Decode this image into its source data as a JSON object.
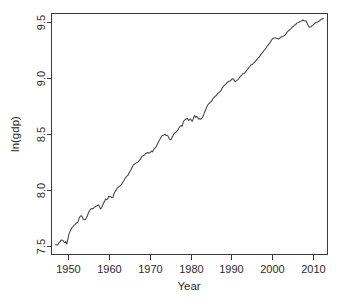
{
  "chart_data": {
    "type": "line",
    "title": "",
    "xlabel": "Year",
    "ylabel": "ln(gdp)",
    "xlim": [
      1946.0,
      1913.0
    ],
    "x_range": [
      1946.0,
      2013.5
    ],
    "ylim": [
      7.42,
      9.58
    ],
    "grid": false,
    "legend": null,
    "xticks": [
      1950,
      1960,
      1970,
      1980,
      1990,
      2000,
      2010
    ],
    "xtick_labels": [
      "1950",
      "1960",
      "1970",
      "1980",
      "1990",
      "2000",
      "2010"
    ],
    "yticks": [
      7.5,
      8.0,
      8.5,
      9.0,
      9.5
    ],
    "ytick_labels": [
      "7.5",
      "8.0",
      "8.5",
      "9.0",
      "9.5"
    ],
    "line_color": "#4a4a4a",
    "frame_color": "#3a3a3a",
    "background": "#ffffff",
    "series": [
      {
        "name": "ln(gdp)",
        "x": [
          1947.0,
          1947.25,
          1947.5,
          1947.75,
          1948.0,
          1948.25,
          1948.5,
          1948.75,
          1949.0,
          1949.25,
          1949.5,
          1949.75,
          1950.0,
          1950.25,
          1950.5,
          1950.75,
          1951.0,
          1951.25,
          1951.5,
          1951.75,
          1952.0,
          1952.25,
          1952.5,
          1952.75,
          1953.0,
          1953.25,
          1953.5,
          1953.75,
          1954.0,
          1954.25,
          1954.5,
          1954.75,
          1955.0,
          1955.25,
          1955.5,
          1955.75,
          1956.0,
          1956.25,
          1956.5,
          1956.75,
          1957.0,
          1957.25,
          1957.5,
          1957.75,
          1958.0,
          1958.25,
          1958.5,
          1958.75,
          1959.0,
          1959.25,
          1959.5,
          1959.75,
          1960.0,
          1960.25,
          1960.5,
          1960.75,
          1961.0,
          1961.25,
          1961.5,
          1961.75,
          1962.0,
          1962.25,
          1962.5,
          1962.75,
          1963.0,
          1963.25,
          1963.5,
          1963.75,
          1964.0,
          1964.25,
          1964.5,
          1964.75,
          1965.0,
          1965.25,
          1965.5,
          1965.75,
          1966.0,
          1966.25,
          1966.5,
          1966.75,
          1967.0,
          1967.25,
          1967.5,
          1967.75,
          1968.0,
          1968.25,
          1968.5,
          1968.75,
          1969.0,
          1969.25,
          1969.5,
          1969.75,
          1970.0,
          1970.25,
          1970.5,
          1970.75,
          1971.0,
          1971.25,
          1971.5,
          1971.75,
          1972.0,
          1972.25,
          1972.5,
          1972.75,
          1973.0,
          1973.25,
          1973.5,
          1973.75,
          1974.0,
          1974.25,
          1974.5,
          1974.75,
          1975.0,
          1975.25,
          1975.5,
          1975.75,
          1976.0,
          1976.25,
          1976.5,
          1976.75,
          1977.0,
          1977.25,
          1977.5,
          1977.75,
          1978.0,
          1978.25,
          1978.5,
          1978.75,
          1979.0,
          1979.25,
          1979.5,
          1979.75,
          1980.0,
          1980.25,
          1980.5,
          1980.75,
          1981.0,
          1981.25,
          1981.5,
          1981.75,
          1982.0,
          1982.25,
          1982.5,
          1982.75,
          1983.0,
          1983.25,
          1983.5,
          1983.75,
          1984.0,
          1984.25,
          1984.5,
          1984.75,
          1985.0,
          1985.25,
          1985.5,
          1985.75,
          1986.0,
          1986.25,
          1986.5,
          1986.75,
          1987.0,
          1987.25,
          1987.5,
          1987.75,
          1988.0,
          1988.25,
          1988.5,
          1988.75,
          1989.0,
          1989.25,
          1989.5,
          1989.75,
          1990.0,
          1990.25,
          1990.5,
          1990.75,
          1991.0,
          1991.25,
          1991.5,
          1991.75,
          1992.0,
          1992.25,
          1992.5,
          1992.75,
          1993.0,
          1993.25,
          1993.5,
          1993.75,
          1994.0,
          1994.25,
          1994.5,
          1994.75,
          1995.0,
          1995.25,
          1995.5,
          1995.75,
          1996.0,
          1996.25,
          1996.5,
          1996.75,
          1997.0,
          1997.25,
          1997.5,
          1997.75,
          1998.0,
          1998.25,
          1998.5,
          1998.75,
          1999.0,
          1999.25,
          1999.5,
          1999.75,
          2000.0,
          2000.25,
          2000.5,
          2000.75,
          2001.0,
          2001.25,
          2001.5,
          2001.75,
          2002.0,
          2002.25,
          2002.5,
          2002.75,
          2003.0,
          2003.25,
          2003.5,
          2003.75,
          2004.0,
          2004.25,
          2004.5,
          2004.75,
          2005.0,
          2005.25,
          2005.5,
          2005.75,
          2006.0,
          2006.25,
          2006.5,
          2006.75,
          2007.0,
          2007.25,
          2007.5,
          2007.75,
          2008.0,
          2008.25,
          2008.5,
          2008.75,
          2009.0,
          2009.25,
          2009.5,
          2009.75,
          2010.0,
          2010.25,
          2010.5,
          2010.75,
          2011.0,
          2011.25,
          2011.5,
          2011.75,
          2012.0,
          2012.25,
          2012.5
        ],
        "y": [
          7.51,
          7.505,
          7.505,
          7.52,
          7.53,
          7.545,
          7.55,
          7.548,
          7.535,
          7.525,
          7.535,
          7.515,
          7.56,
          7.6,
          7.625,
          7.645,
          7.66,
          7.668,
          7.682,
          7.688,
          7.7,
          7.705,
          7.712,
          7.745,
          7.76,
          7.768,
          7.758,
          7.738,
          7.732,
          7.732,
          7.745,
          7.765,
          7.79,
          7.81,
          7.822,
          7.832,
          7.828,
          7.835,
          7.842,
          7.85,
          7.855,
          7.858,
          7.866,
          7.845,
          7.828,
          7.838,
          7.862,
          7.882,
          7.9,
          7.918,
          7.912,
          7.918,
          7.942,
          7.938,
          7.94,
          7.928,
          7.93,
          7.962,
          7.98,
          7.995,
          8.01,
          8.02,
          8.028,
          8.035,
          8.045,
          8.058,
          8.072,
          8.085,
          8.102,
          8.115,
          8.125,
          8.132,
          8.152,
          8.168,
          8.185,
          8.205,
          8.222,
          8.228,
          8.235,
          8.242,
          8.245,
          8.252,
          8.265,
          8.272,
          8.292,
          8.302,
          8.308,
          8.312,
          8.325,
          8.33,
          8.334,
          8.328,
          8.332,
          8.338,
          8.348,
          8.34,
          8.362,
          8.372,
          8.382,
          8.4,
          8.418,
          8.435,
          8.45,
          8.468,
          8.485,
          8.488,
          8.492,
          8.498,
          8.488,
          8.488,
          8.482,
          8.462,
          8.448,
          8.45,
          8.472,
          8.488,
          8.505,
          8.512,
          8.518,
          8.528,
          8.542,
          8.558,
          8.572,
          8.575,
          8.572,
          8.612,
          8.622,
          8.63,
          8.638,
          8.64,
          8.622,
          8.628,
          8.635,
          8.618,
          8.615,
          8.648,
          8.665,
          8.648,
          8.658,
          8.65,
          8.632,
          8.638,
          8.632,
          8.64,
          8.652,
          8.678,
          8.7,
          8.722,
          8.745,
          8.762,
          8.772,
          8.78,
          8.79,
          8.802,
          8.818,
          8.828,
          8.838,
          8.842,
          8.852,
          8.868,
          8.872,
          8.882,
          8.892,
          8.912,
          8.925,
          8.935,
          8.942,
          8.952,
          8.962,
          8.968,
          8.975,
          8.978,
          8.988,
          8.995,
          8.992,
          8.978,
          8.972,
          8.978,
          8.985,
          8.995,
          9.008,
          9.018,
          9.025,
          9.04,
          9.04,
          9.048,
          9.058,
          9.072,
          9.082,
          9.095,
          9.105,
          9.118,
          9.122,
          9.128,
          9.138,
          9.145,
          9.158,
          9.168,
          9.18,
          9.188,
          9.2,
          9.215,
          9.225,
          9.235,
          9.25,
          9.258,
          9.272,
          9.288,
          9.298,
          9.31,
          9.322,
          9.338,
          9.352,
          9.358,
          9.36,
          9.362,
          9.358,
          9.355,
          9.352,
          9.358,
          9.362,
          9.372,
          9.375,
          9.378,
          9.382,
          9.392,
          9.408,
          9.418,
          9.428,
          9.435,
          9.442,
          9.452,
          9.462,
          9.468,
          9.478,
          9.482,
          9.495,
          9.498,
          9.502,
          9.508,
          9.51,
          9.515,
          9.522,
          9.515,
          9.512,
          9.515,
          9.495,
          9.475,
          9.46,
          9.458,
          9.462,
          9.472,
          9.478,
          9.488,
          9.495,
          9.502,
          9.502,
          9.508,
          9.512,
          9.522,
          9.528,
          9.532,
          9.535
        ]
      }
    ],
    "annotations": []
  },
  "axis": {
    "y_title": "ln(gdp)",
    "x_title": "Year"
  }
}
